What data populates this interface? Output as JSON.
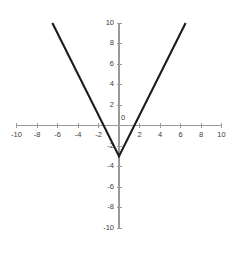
{
  "chart_data": {
    "type": "line",
    "title": "",
    "subtitle": "",
    "xlabel": "",
    "ylabel": "",
    "xlim": [
      -10,
      10
    ],
    "ylim": [
      -10,
      10
    ],
    "grid": false,
    "legend": null,
    "x_ticks": [
      -10,
      -8,
      -6,
      -4,
      -2,
      0,
      2,
      4,
      6,
      8,
      10
    ],
    "x_tick_labels": [
      "-10",
      "-8",
      "-6",
      "-4",
      "-2",
      "0",
      "2",
      "4",
      "6",
      "8",
      "10"
    ],
    "y_ticks": [
      -10,
      -8,
      -6,
      -4,
      -2,
      0,
      2,
      4,
      6,
      8,
      10
    ],
    "y_tick_labels": [
      "-10",
      "-8",
      "-6",
      "-4",
      "-2",
      "0",
      "2",
      "4",
      "6",
      "8",
      "10"
    ],
    "series": [
      {
        "name": "y = 2|x| - 3",
        "shape": "v",
        "vertex": [
          0,
          -3
        ],
        "slope": 2,
        "x": [
          -6.5,
          0,
          6.5
        ],
        "values": [
          10,
          -3,
          10
        ],
        "color": "#1b1b1b"
      }
    ],
    "annotations": [],
    "colors": {
      "axis": "#9a9a9a",
      "curve": "#1b1b1b",
      "tick_text": "#3c3c3c",
      "background": "#ffffff"
    }
  },
  "geometry": {
    "origin_px": [
      119,
      125.5
    ],
    "unit_px": 10.25,
    "width": 242,
    "height": 253
  }
}
